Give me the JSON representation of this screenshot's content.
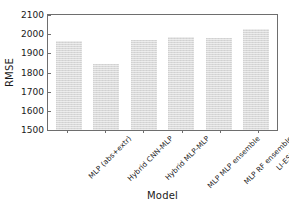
{
  "chart_data": {
    "type": "bar",
    "title": "",
    "xlabel": "Model",
    "ylabel": "RMSE",
    "categories": [
      "MLP (abs+extr)",
      "Hybrid CNN-MLP",
      "Hybrid MLP-MLP",
      "MLP MLP ensemble",
      "MLP RF ensemble",
      "LI-ESN (abs)"
    ],
    "values": [
      1967,
      1845,
      1970,
      1983,
      1978,
      2028
    ],
    "ylim": [
      1500,
      2100
    ],
    "yticks": [
      1500,
      1600,
      1700,
      1800,
      1900,
      2000,
      2100
    ],
    "ytick_labels": [
      "1500",
      "1600",
      "1700",
      "1800",
      "1900",
      "2000",
      "2100"
    ],
    "grid": false,
    "legend": null,
    "bar_color": "#d8d8d8",
    "axis_color": "#6e6e6e"
  }
}
